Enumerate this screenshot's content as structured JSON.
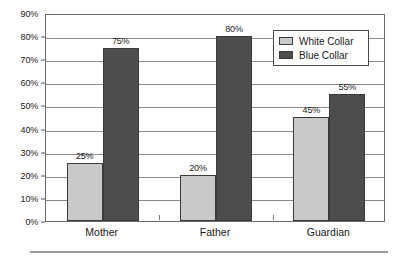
{
  "chart_data": {
    "type": "bar",
    "title": "",
    "subtitle": "",
    "xlabel": "",
    "ylabel": "",
    "categories": [
      "Mother",
      "Father",
      "Guardian"
    ],
    "series": [
      {
        "name": "White Collar",
        "color": "#c9c9c9",
        "values": [
          25,
          20,
          45
        ],
        "labels": [
          "25%",
          "20%",
          "45%"
        ]
      },
      {
        "name": "Blue Collar",
        "color": "#4d4d4d",
        "values": [
          75,
          80,
          55
        ],
        "labels": [
          "75%",
          "80%",
          "55%"
        ]
      }
    ],
    "ylim": [
      0,
      90
    ],
    "ytick_values": [
      0,
      10,
      20,
      30,
      40,
      50,
      60,
      70,
      80,
      90
    ],
    "ytick_labels": [
      "0%",
      "10%",
      "20%",
      "30%",
      "40%",
      "50%",
      "60%",
      "70%",
      "80%",
      "90%"
    ],
    "grid": true,
    "grid_axis": "y",
    "legend_position": "top-right",
    "legend_entries": [
      "White Collar",
      "Blue Collar"
    ],
    "value_labels_shown": true,
    "value_label_unit": "%"
  },
  "legend": {
    "items": [
      {
        "label": "White Collar",
        "swatch": "legend-swatch-white-collar"
      },
      {
        "label": "Blue Collar",
        "swatch": "legend-swatch-blue-collar"
      }
    ]
  },
  "colors": {
    "white_collar": "#c9c9c9",
    "blue_collar": "#4d4d4d",
    "axis": "#6b6b6b",
    "gridline": "#8a8a8a",
    "text": "#1a1a1a",
    "rule": "#9a9a9a",
    "background": "#ffffff"
  }
}
